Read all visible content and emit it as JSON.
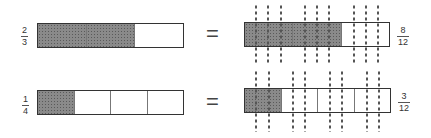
{
  "rows": [
    {
      "left_fraction": {
        "numerator": "2",
        "denominator": "3"
      },
      "left_bar": {
        "parts": 3,
        "shaded": 2
      },
      "equals": "=",
      "right_bar": {
        "parts": 3,
        "shaded": 2,
        "subdivisions_per_part": 4
      },
      "right_fraction": {
        "numerator": "8",
        "denominator": "12"
      }
    },
    {
      "left_fraction": {
        "numerator": "1",
        "denominator": "4"
      },
      "left_bar": {
        "parts": 4,
        "shaded": 1
      },
      "equals": "=",
      "right_bar": {
        "parts": 4,
        "shaded": 1,
        "subdivisions_per_part": 3
      },
      "right_fraction": {
        "numerator": "3",
        "denominator": "12"
      }
    }
  ],
  "colors": {
    "shade": "#8a8a8a",
    "outline": "#333333",
    "dots": "#555555"
  }
}
